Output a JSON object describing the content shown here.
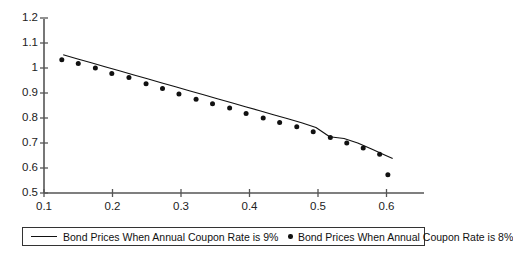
{
  "chart_data": {
    "type": "scatter",
    "title": "",
    "xlabel": "",
    "ylabel": "",
    "xlim": [
      0.1,
      0.615
    ],
    "ylim": [
      0.5,
      1.2
    ],
    "xticks": [
      "0.1",
      "0.2",
      "0.3",
      "0.4",
      "0.5",
      "0.6"
    ],
    "xtick_values": [
      0.1,
      0.2,
      0.3,
      0.4,
      0.5,
      0.6
    ],
    "yticks": [
      "0.5",
      "0.6",
      "0.7",
      "0.8",
      "0.9",
      "1",
      "1.1",
      "1.2"
    ],
    "ytick_values": [
      0.5,
      0.6,
      0.7,
      0.8,
      0.9,
      1.0,
      1.1,
      1.2
    ],
    "grid": false,
    "legend_position": "bottom",
    "series": [
      {
        "name": "Bond Prices When Annual Coupon Rate is 9%",
        "marker": "line",
        "x": [
          0.128,
          0.148,
          0.169,
          0.189,
          0.21,
          0.23,
          0.251,
          0.271,
          0.292,
          0.312,
          0.333,
          0.353,
          0.374,
          0.394,
          0.415,
          0.435,
          0.456,
          0.476,
          0.497,
          0.517,
          0.538,
          0.558,
          0.579,
          0.599,
          0.609
        ],
        "values": [
          1.053,
          1.037,
          1.021,
          1.005,
          0.989,
          0.973,
          0.957,
          0.941,
          0.925,
          0.909,
          0.893,
          0.877,
          0.861,
          0.845,
          0.829,
          0.813,
          0.797,
          0.781,
          0.762,
          0.725,
          0.718,
          0.7,
          0.675,
          0.65,
          0.638
        ]
      },
      {
        "name": "Bond Prices When Annual Coupon Rate is 8%",
        "marker": "dot",
        "x": [
          0.126,
          0.15,
          0.175,
          0.199,
          0.224,
          0.249,
          0.273,
          0.297,
          0.322,
          0.346,
          0.371,
          0.395,
          0.42,
          0.444,
          0.469,
          0.493,
          0.518,
          0.542,
          0.566,
          0.59,
          0.602
        ],
        "values": [
          1.033,
          1.018,
          1.0,
          0.978,
          0.962,
          0.937,
          0.918,
          0.896,
          0.875,
          0.857,
          0.84,
          0.818,
          0.8,
          0.782,
          0.765,
          0.745,
          0.722,
          0.7,
          0.68,
          0.655,
          0.573
        ]
      }
    ]
  },
  "legend": {
    "entries": [
      {
        "label": "Bond Prices When Annual Coupon Rate is 9%",
        "marker": "line"
      },
      {
        "label": "Bond Prices When Annual Coupon Rate is 8%",
        "marker": "dot"
      }
    ]
  },
  "colors": {
    "line": "#111111",
    "marker": "#111111",
    "axis": "#555555",
    "text": "#222222",
    "background": "#ffffff"
  }
}
